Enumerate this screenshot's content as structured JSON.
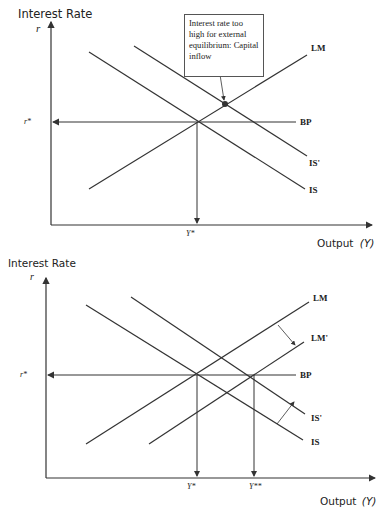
{
  "diagram_top": {
    "y_axis_title": "Interest Rate",
    "y_axis_symbol": "r",
    "x_axis_title": "Output",
    "x_axis_symbol": "(Y)",
    "r_star_label": "r*",
    "y_star_label": "Y*",
    "curves": {
      "lm": "LM",
      "bp": "BP",
      "is_prime": "IS'",
      "is": "IS"
    },
    "callout_text": "Interest rate too high for external equilibrium: Capital inflow"
  },
  "diagram_bottom": {
    "y_axis_title": "Interest Rate",
    "y_axis_symbol": "r",
    "x_axis_title": "Output",
    "x_axis_symbol": "(Y)",
    "r_star_label": "r*",
    "y_star_label": "Y*",
    "y_double_star_label": "Y**",
    "curves": {
      "lm": "LM",
      "lm_prime": "LM'",
      "bp": "BP",
      "is_prime": "IS'",
      "is": "IS"
    }
  },
  "colors": {
    "line": "#333333",
    "text": "#222222",
    "dot": "#333333"
  }
}
